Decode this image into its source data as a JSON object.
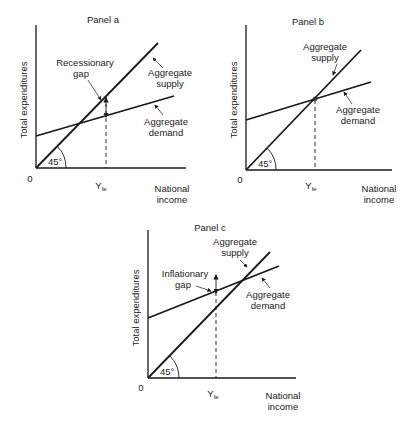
{
  "panels": [
    {
      "title": "Panel a",
      "y_axis_label": "Total expenditures",
      "x_axis_label_line1": "National",
      "x_axis_label_line2": "income",
      "origin_label": "0",
      "yfe_label": "Y",
      "yfe_sub": "fe",
      "angle_label": "45°",
      "gap_label_line1": "Recessionary",
      "gap_label_line2": "gap",
      "supply_label_line1": "Aggregate",
      "supply_label_line2": "supply",
      "demand_label_line1": "Aggregate",
      "demand_label_line2": "demand"
    },
    {
      "title": "Panel b",
      "y_axis_label": "Total expenditures",
      "x_axis_label_line1": "National",
      "x_axis_label_line2": "income",
      "origin_label": "0",
      "yfe_label": "Y",
      "yfe_sub": "fe",
      "angle_label": "45°",
      "supply_label_line1": "Aggregate",
      "supply_label_line2": "supply",
      "demand_label_line1": "Aggregate",
      "demand_label_line2": "demand"
    },
    {
      "title": "Panel c",
      "y_axis_label": "Total expenditures",
      "x_axis_label_line1": "National",
      "x_axis_label_line2": "income",
      "origin_label": "0",
      "yfe_label": "Y",
      "yfe_sub": "fe",
      "angle_label": "45°",
      "gap_label_line1": "Inflationary",
      "gap_label_line2": "gap",
      "supply_label_line1": "Aggregate",
      "supply_label_line2": "supply",
      "demand_label_line1": "Aggregate",
      "demand_label_line2": "demand"
    }
  ]
}
